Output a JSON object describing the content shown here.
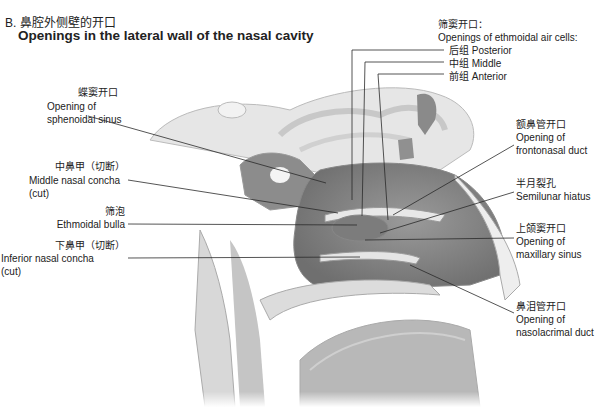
{
  "title": {
    "zh": "B. 鼻腔外侧壁的开口",
    "en": "Openings in the lateral wall of the nasal cavity"
  },
  "labels": {
    "sphenoidal": {
      "zh": "蝶窦开口",
      "en1": "Opening of",
      "en2": "sphenoidal sinus"
    },
    "middle_concha": {
      "zh": "中鼻甲（切断）",
      "en1": "Middle nasal concha",
      "en2": "(cut)"
    },
    "ethmoidal_bulla": {
      "zh": "筛泡",
      "en1": "Ethmoidal bulla"
    },
    "inferior_concha": {
      "zh": "下鼻甲（切断）",
      "en1": "Inferior nasal concha",
      "en2": "(cut)"
    },
    "ethmoid_cells": {
      "zh": "筛窦开口：",
      "en": "Openings of ethmoidal air cells:",
      "posterior": "后组 Posterior",
      "middle": "中组 Middle",
      "anterior": "前组 Anterior"
    },
    "frontonasal": {
      "zh": "额鼻管开口",
      "en1": "Opening of",
      "en2": "frontonasal duct"
    },
    "semilunar": {
      "zh": "半月裂孔",
      "en1": "Semilunar hiatus"
    },
    "maxillary": {
      "zh": "上颌窦开口",
      "en1": "Opening of",
      "en2": "maxillary sinus"
    },
    "nasolacrimal": {
      "zh": "鼻泪管开口",
      "en1": "Opening of",
      "en2": "nasolacrimal duct"
    }
  }
}
